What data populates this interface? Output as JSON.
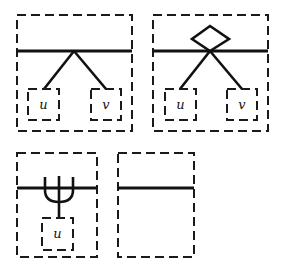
{
  "diagram": {
    "panels": [
      {
        "id": "panel-1",
        "description": "Branching node: apex on divider with edges to two children",
        "children": [
          {
            "label": "u"
          },
          {
            "label": "v"
          }
        ]
      },
      {
        "id": "panel-2",
        "description": "Diamond node above divider with edges to two children",
        "children": [
          {
            "label": "u"
          },
          {
            "label": "v"
          }
        ]
      },
      {
        "id": "panel-3",
        "description": "Fork (psi-shaped) node crossing divider with one child",
        "children": [
          {
            "label": "u"
          }
        ]
      },
      {
        "id": "panel-4",
        "description": "Empty frame with divider only",
        "children": []
      }
    ],
    "colors": {
      "stroke": "#111111",
      "background": "#ffffff"
    }
  }
}
